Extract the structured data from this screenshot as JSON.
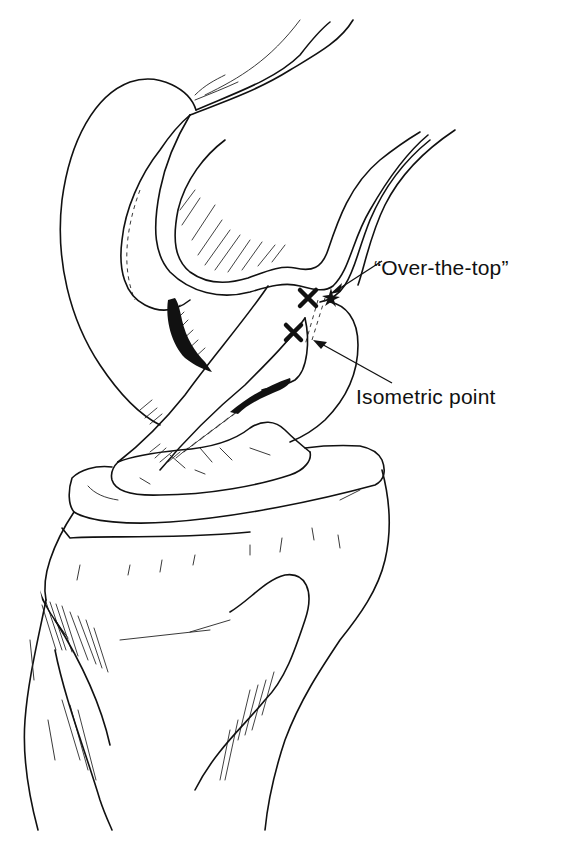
{
  "figure": {
    "labels": {
      "over_the_top": "“Over-the-top”",
      "isometric_point": "Isometric point"
    },
    "markers": [
      {
        "name": "over-the-top-marker",
        "symbol": "✖"
      },
      {
        "name": "isometric-point-marker",
        "symbol": "✖"
      }
    ],
    "colors": {
      "ink": "#111111",
      "background": "#ffffff"
    }
  }
}
